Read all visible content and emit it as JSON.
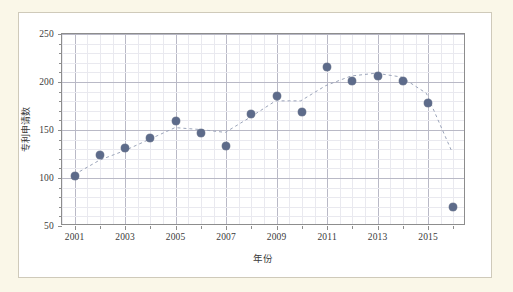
{
  "chart_data": {
    "type": "scatter",
    "title": "",
    "xlabel": "年份",
    "ylabel": "专利申请数",
    "x": [
      2001,
      2002,
      2003,
      2004,
      2005,
      2006,
      2007,
      2008,
      2009,
      2010,
      2011,
      2012,
      2013,
      2014,
      2015,
      2016
    ],
    "values": [
      102,
      124,
      131,
      142,
      159,
      147,
      133,
      167,
      185,
      169,
      216,
      201,
      206,
      201,
      178,
      70
    ],
    "series": [
      {
        "name": "专利申请数",
        "values": [
          102,
          124,
          131,
          142,
          159,
          147,
          133,
          167,
          185,
          169,
          216,
          201,
          206,
          201,
          178,
          70
        ],
        "marker_color": "#5d6b8a"
      }
    ],
    "trendline": {
      "style": "dashed",
      "color": "#9aa3b8",
      "x": [
        2001,
        2002,
        2003,
        2004,
        2005,
        2006,
        2007,
        2008,
        2009,
        2010,
        2011,
        2012,
        2013,
        2014,
        2015,
        2016
      ],
      "values": [
        103,
        118,
        128,
        140,
        152,
        150,
        147,
        163,
        180,
        180,
        196,
        206,
        209,
        205,
        188,
        128
      ]
    },
    "xlim": [
      2000.5,
      2016.5
    ],
    "ylim": [
      50,
      250
    ],
    "xticks": [
      2001,
      2003,
      2005,
      2007,
      2009,
      2011,
      2013,
      2015
    ],
    "xticklabels": [
      "2001",
      "2003",
      "2005",
      "2007",
      "2009",
      "2011",
      "2013",
      "2015"
    ],
    "yticks": [
      50,
      100,
      150,
      200,
      250
    ],
    "yticklabels": [
      "50",
      "100",
      "150",
      "200",
      "250"
    ],
    "grid": true,
    "grid_minor": true,
    "legend": "none",
    "ytick_minor_step": 10,
    "xtick_minor_step": 1
  },
  "figure": {
    "background_outer": "#faf7e8",
    "background_panel": "#ffffff",
    "border_color": "#cfcaba",
    "axis_color": "#8d8d8d",
    "grid_major_color": "#b9b9c6",
    "grid_minor_color": "#e9e9ef"
  }
}
